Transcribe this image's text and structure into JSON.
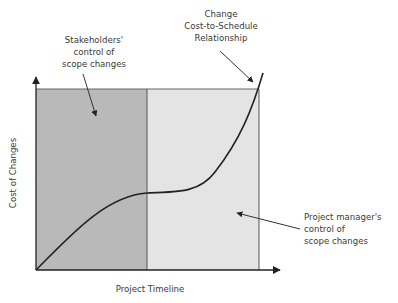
{
  "diagram": {
    "title": "",
    "x_axis_label": "Project Timeline",
    "y_axis_label": "Cost of Changes",
    "regions": [
      {
        "name": "stakeholders-region",
        "color": "#b9b9b9"
      },
      {
        "name": "project-manager-region",
        "color": "#e4e4e4"
      }
    ],
    "annotations": {
      "stakeholders": [
        "Stakeholders'",
        "control of",
        "scope changes"
      ],
      "cost_schedule": [
        "Change",
        "Cost-to-Schedule",
        "Relationship"
      ],
      "project_manager": [
        "Project manager's",
        "control of",
        "scope changes"
      ]
    },
    "colors": {
      "line": "#222222",
      "border": "#555555",
      "text": "#3a3a3a"
    }
  }
}
